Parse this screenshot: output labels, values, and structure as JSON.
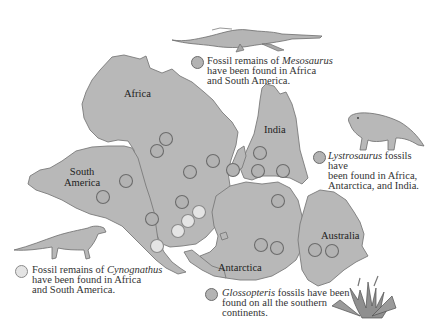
{
  "colors": {
    "land": "#b8b8b8",
    "coast": "#7a7a7a",
    "dot_dark": "#b3b3b3",
    "dot_light": "#e4e4e4",
    "text": "#333333"
  },
  "continents": {
    "africa": "Africa",
    "south_america_line1": "South",
    "south_america_line2": "America",
    "india": "India",
    "antarctica": "Antarctica",
    "australia": "Australia"
  },
  "legend": {
    "mesosaurus": {
      "line1_pre": "Fossil remains of ",
      "line1_italic": "Mesosaurus",
      "line2": "have been found in Africa",
      "line3": "and South America.",
      "marker": "dark-circle"
    },
    "lystrosaurus": {
      "line1_italic": "Lystrosaurus",
      "line1_post": " fossils have",
      "line2": "been found in Africa,",
      "line3": "Antarctica, and India.",
      "marker": "dark-circle"
    },
    "cynognathus": {
      "line1_pre": "Fossil remains of ",
      "line1_italic": "Cynognathus",
      "line2": "have been found in Africa",
      "line3": "and South America.",
      "marker": "light-circle"
    },
    "glossopteris": {
      "line1_italic": "Glossopteris",
      "line1_post": " fossils have been",
      "line2": "found on all the southern",
      "line3": "continents.",
      "marker": "dark-circle"
    }
  },
  "illustrations": [
    "mesosaurus-illustration",
    "lystrosaurus-illustration",
    "cynognathus-illustration",
    "glossopteris-illustration"
  ]
}
